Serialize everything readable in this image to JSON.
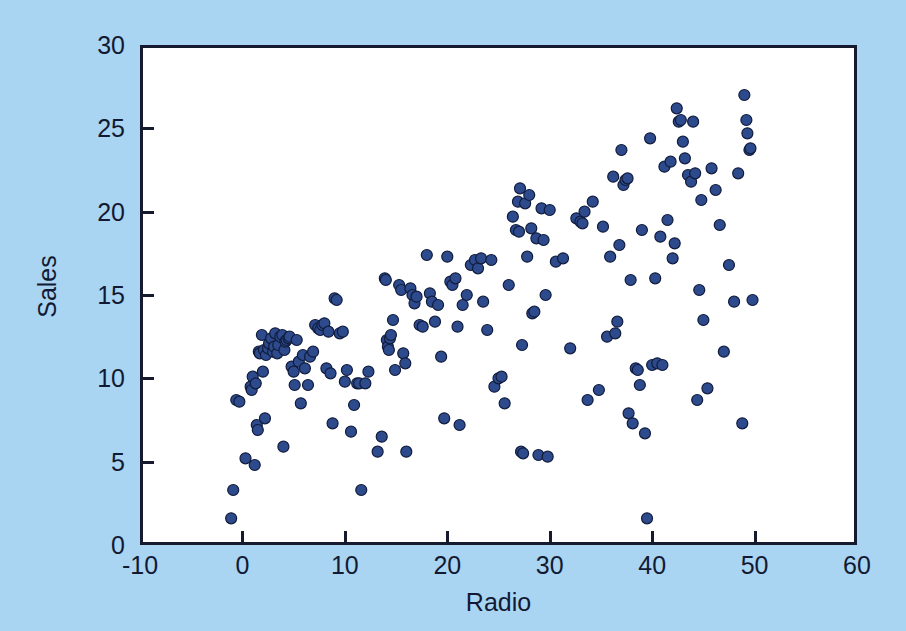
{
  "figure": {
    "background_color": "#a9d4f2",
    "plot_background_color": "#ffffff",
    "frame_color": "#161a2e",
    "marker_fill_color": "#2c4a8c",
    "marker_edge_color": "#111c3c"
  },
  "axes": {
    "xlabel": "Radio",
    "ylabel": "Sales"
  },
  "chart_data": {
    "type": "scatter",
    "title": "",
    "xlabel": "Radio",
    "ylabel": "Sales",
    "xlim": [
      -10,
      60
    ],
    "ylim": [
      0,
      30
    ],
    "xticks": [
      -10,
      0,
      10,
      20,
      30,
      40,
      50,
      60
    ],
    "yticks": [
      0,
      5,
      10,
      15,
      20,
      25,
      30
    ],
    "xtick_labels": [
      "-10",
      "0",
      "10",
      "20",
      "30",
      "40",
      "50",
      "60"
    ],
    "ytick_labels": [
      "0",
      "5",
      "10",
      "15",
      "20",
      "25",
      "30"
    ],
    "grid": false,
    "legend": null,
    "marker": "filled-circle",
    "marker_size_px": 11,
    "series": [
      {
        "name": "Sales vs Radio",
        "points": [
          [
            -1.1,
            1.6
          ],
          [
            -0.9,
            3.3
          ],
          [
            -0.6,
            8.7
          ],
          [
            -0.3,
            8.6
          ],
          [
            0.3,
            5.2
          ],
          [
            0.8,
            9.5
          ],
          [
            0.9,
            9.3
          ],
          [
            1.0,
            10.1
          ],
          [
            1.2,
            4.8
          ],
          [
            1.3,
            9.7
          ],
          [
            1.4,
            7.2
          ],
          [
            1.5,
            6.9
          ],
          [
            1.6,
            11.6
          ],
          [
            1.7,
            11.5
          ],
          [
            1.9,
            12.6
          ],
          [
            2.0,
            10.4
          ],
          [
            2.1,
            11.7
          ],
          [
            2.2,
            7.6
          ],
          [
            2.3,
            11.4
          ],
          [
            2.5,
            11.8
          ],
          [
            2.6,
            12.1
          ],
          [
            2.8,
            12.4
          ],
          [
            3.0,
            11.6
          ],
          [
            3.1,
            11.9
          ],
          [
            3.2,
            12.7
          ],
          [
            3.4,
            11.5
          ],
          [
            3.5,
            12.0
          ],
          [
            3.7,
            12.5
          ],
          [
            3.9,
            12.6
          ],
          [
            4.0,
            5.9
          ],
          [
            4.1,
            11.7
          ],
          [
            4.2,
            12.2
          ],
          [
            4.3,
            12.3
          ],
          [
            4.5,
            12.4
          ],
          [
            4.6,
            12.5
          ],
          [
            4.8,
            10.7
          ],
          [
            5.0,
            10.4
          ],
          [
            5.1,
            9.6
          ],
          [
            5.3,
            12.3
          ],
          [
            5.5,
            11.0
          ],
          [
            5.7,
            8.5
          ],
          [
            5.9,
            11.4
          ],
          [
            6.1,
            10.6
          ],
          [
            6.4,
            9.6
          ],
          [
            6.6,
            11.3
          ],
          [
            6.9,
            11.6
          ],
          [
            7.1,
            13.2
          ],
          [
            7.4,
            13.0
          ],
          [
            7.6,
            12.9
          ],
          [
            7.8,
            13.2
          ],
          [
            8.0,
            13.3
          ],
          [
            8.2,
            10.6
          ],
          [
            8.4,
            12.8
          ],
          [
            8.6,
            10.3
          ],
          [
            8.8,
            7.3
          ],
          [
            9.0,
            14.8
          ],
          [
            9.2,
            14.7
          ],
          [
            9.5,
            12.7
          ],
          [
            9.8,
            12.8
          ],
          [
            10.0,
            9.8
          ],
          [
            10.2,
            10.5
          ],
          [
            10.6,
            6.8
          ],
          [
            10.9,
            8.4
          ],
          [
            11.2,
            9.7
          ],
          [
            11.4,
            9.7
          ],
          [
            11.6,
            3.3
          ],
          [
            12.0,
            9.7
          ],
          [
            12.3,
            10.4
          ],
          [
            13.2,
            5.6
          ],
          [
            13.6,
            6.5
          ],
          [
            13.9,
            16.0
          ],
          [
            14.0,
            15.9
          ],
          [
            14.1,
            12.3
          ],
          [
            14.2,
            11.9
          ],
          [
            14.3,
            11.7
          ],
          [
            14.4,
            12.4
          ],
          [
            14.5,
            12.6
          ],
          [
            14.7,
            13.5
          ],
          [
            14.9,
            10.5
          ],
          [
            15.3,
            15.6
          ],
          [
            15.5,
            15.3
          ],
          [
            15.7,
            11.5
          ],
          [
            15.9,
            10.9
          ],
          [
            16.0,
            5.6
          ],
          [
            16.4,
            15.4
          ],
          [
            16.6,
            15.0
          ],
          [
            16.8,
            14.5
          ],
          [
            17.0,
            14.9
          ],
          [
            17.3,
            13.2
          ],
          [
            17.6,
            13.1
          ],
          [
            18.0,
            17.4
          ],
          [
            18.3,
            15.1
          ],
          [
            18.5,
            14.6
          ],
          [
            18.8,
            13.4
          ],
          [
            19.1,
            14.4
          ],
          [
            19.4,
            11.3
          ],
          [
            19.7,
            7.6
          ],
          [
            20.0,
            17.3
          ],
          [
            20.3,
            15.8
          ],
          [
            20.5,
            15.6
          ],
          [
            20.8,
            16.0
          ],
          [
            21.0,
            13.1
          ],
          [
            21.2,
            7.2
          ],
          [
            21.5,
            14.4
          ],
          [
            21.9,
            15.0
          ],
          [
            22.3,
            16.8
          ],
          [
            22.7,
            17.1
          ],
          [
            23.0,
            16.6
          ],
          [
            23.3,
            17.2
          ],
          [
            23.5,
            14.6
          ],
          [
            23.9,
            12.9
          ],
          [
            24.3,
            17.1
          ],
          [
            24.6,
            9.5
          ],
          [
            25.0,
            10.0
          ],
          [
            25.3,
            10.1
          ],
          [
            25.6,
            8.5
          ],
          [
            26.0,
            15.6
          ],
          [
            26.4,
            19.7
          ],
          [
            26.7,
            18.9
          ],
          [
            26.9,
            20.6
          ],
          [
            27.0,
            18.8
          ],
          [
            27.1,
            21.4
          ],
          [
            27.2,
            5.6
          ],
          [
            27.3,
            12.0
          ],
          [
            27.4,
            5.5
          ],
          [
            27.6,
            20.5
          ],
          [
            27.8,
            17.3
          ],
          [
            28.0,
            21.0
          ],
          [
            28.2,
            19.0
          ],
          [
            28.3,
            13.9
          ],
          [
            28.5,
            14.0
          ],
          [
            28.7,
            18.4
          ],
          [
            28.9,
            5.4
          ],
          [
            29.2,
            20.2
          ],
          [
            29.4,
            18.3
          ],
          [
            29.6,
            15.0
          ],
          [
            29.8,
            5.3
          ],
          [
            30.0,
            20.1
          ],
          [
            30.6,
            17.0
          ],
          [
            31.3,
            17.2
          ],
          [
            32.0,
            11.8
          ],
          [
            32.6,
            19.6
          ],
          [
            33.0,
            19.4
          ],
          [
            33.2,
            19.3
          ],
          [
            33.4,
            20.0
          ],
          [
            33.7,
            8.7
          ],
          [
            34.2,
            20.6
          ],
          [
            34.8,
            9.3
          ],
          [
            35.2,
            19.1
          ],
          [
            35.6,
            12.5
          ],
          [
            35.9,
            17.3
          ],
          [
            36.2,
            22.1
          ],
          [
            36.4,
            12.7
          ],
          [
            36.6,
            13.4
          ],
          [
            36.8,
            18.0
          ],
          [
            37.0,
            23.7
          ],
          [
            37.2,
            21.6
          ],
          [
            37.4,
            21.9
          ],
          [
            37.6,
            22.0
          ],
          [
            37.7,
            7.9
          ],
          [
            37.9,
            15.9
          ],
          [
            38.1,
            7.3
          ],
          [
            38.4,
            10.6
          ],
          [
            38.6,
            10.5
          ],
          [
            38.8,
            9.6
          ],
          [
            39.0,
            18.9
          ],
          [
            39.3,
            6.7
          ],
          [
            39.5,
            1.6
          ],
          [
            39.8,
            24.4
          ],
          [
            40.0,
            10.8
          ],
          [
            40.3,
            16.0
          ],
          [
            40.5,
            10.9
          ],
          [
            40.8,
            18.5
          ],
          [
            41.0,
            10.8
          ],
          [
            41.2,
            22.7
          ],
          [
            41.5,
            19.5
          ],
          [
            41.8,
            23.0
          ],
          [
            42.0,
            17.2
          ],
          [
            42.2,
            18.1
          ],
          [
            42.4,
            26.2
          ],
          [
            42.6,
            25.4
          ],
          [
            42.8,
            25.5
          ],
          [
            43.0,
            24.2
          ],
          [
            43.2,
            23.2
          ],
          [
            43.5,
            22.2
          ],
          [
            43.8,
            21.8
          ],
          [
            44.0,
            25.4
          ],
          [
            44.2,
            22.3
          ],
          [
            44.4,
            8.7
          ],
          [
            44.6,
            15.3
          ],
          [
            44.8,
            20.7
          ],
          [
            45.0,
            13.5
          ],
          [
            45.4,
            9.4
          ],
          [
            45.8,
            22.6
          ],
          [
            46.2,
            21.3
          ],
          [
            46.6,
            19.2
          ],
          [
            47.0,
            11.6
          ],
          [
            47.5,
            16.8
          ],
          [
            48.0,
            14.6
          ],
          [
            48.4,
            22.3
          ],
          [
            48.8,
            7.3
          ],
          [
            49.0,
            27.0
          ],
          [
            49.2,
            25.5
          ],
          [
            49.3,
            24.7
          ],
          [
            49.5,
            23.7
          ],
          [
            49.6,
            23.8
          ],
          [
            49.8,
            14.7
          ]
        ]
      }
    ]
  }
}
